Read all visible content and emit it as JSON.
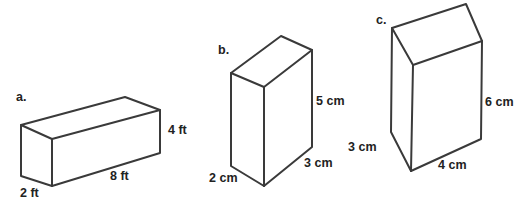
{
  "figures": [
    {
      "tag": "a.",
      "shape": "rectangular prism",
      "dimensions": {
        "length": "8 ft",
        "width": "2 ft",
        "height": "4 ft"
      }
    },
    {
      "tag": "b.",
      "shape": "rectangular prism",
      "dimensions": {
        "length": "3 cm",
        "width": "2 cm",
        "height": "5 cm"
      }
    },
    {
      "tag": "c.",
      "shape": "rectangular prism",
      "dimensions": {
        "length": "4 cm",
        "width": "3 cm",
        "height": "6 cm"
      }
    }
  ],
  "colors": {
    "line": "#3a3a3a",
    "text": "#222222",
    "background": "#ffffff"
  }
}
